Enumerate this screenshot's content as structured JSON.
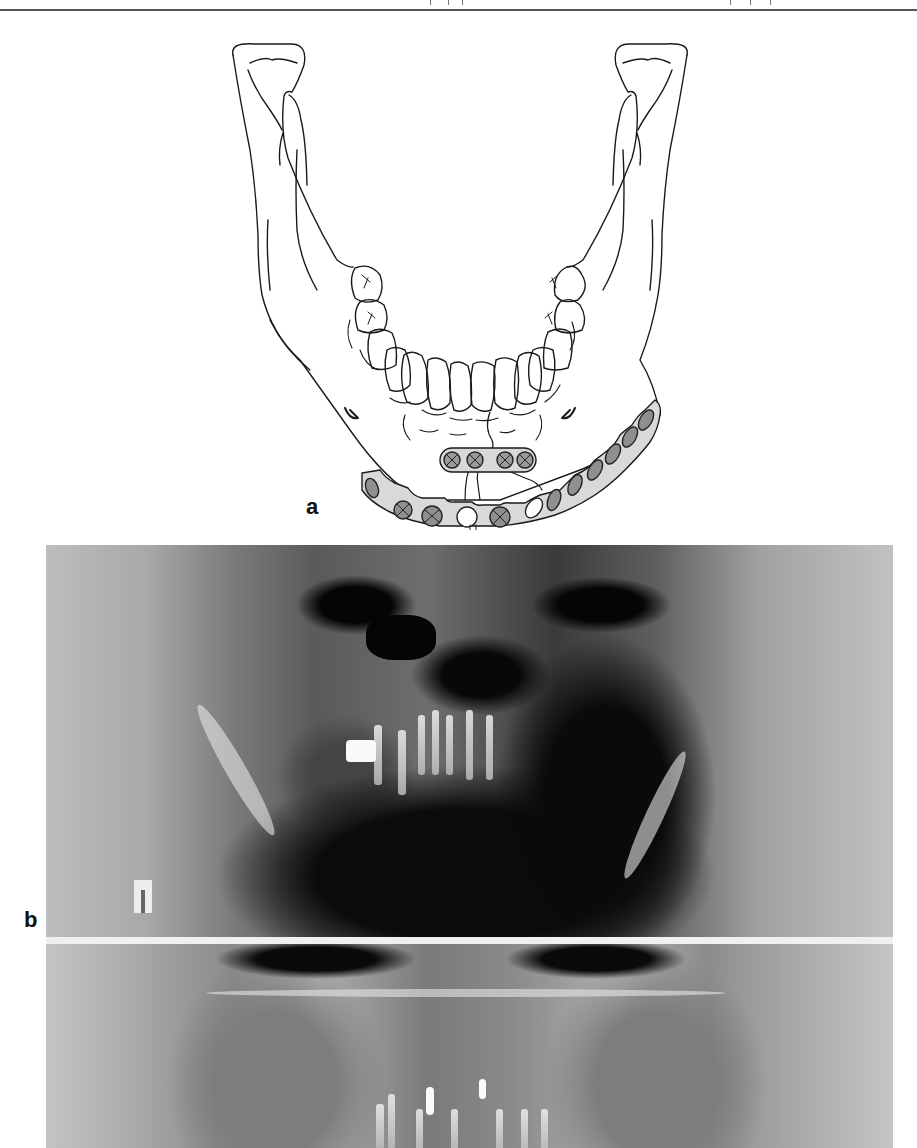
{
  "header": {
    "rule": true
  },
  "figure": {
    "panels": [
      {
        "id": "a",
        "label": "a",
        "type": "illustration",
        "subject": "mandible-with-fixation-plates",
        "plates": [
          {
            "name": "upper-miniplate",
            "screws": 4
          },
          {
            "name": "lower-reconstruction-plate",
            "screw_holes": 12,
            "empty_holes": 2
          }
        ]
      },
      {
        "id": "b",
        "label": "b",
        "type": "panoramic-radiograph",
        "images": 2
      }
    ]
  },
  "colors": {
    "plate_fill": "#d9d9d9",
    "line": "#1a1a1a",
    "background": "#ffffff"
  }
}
